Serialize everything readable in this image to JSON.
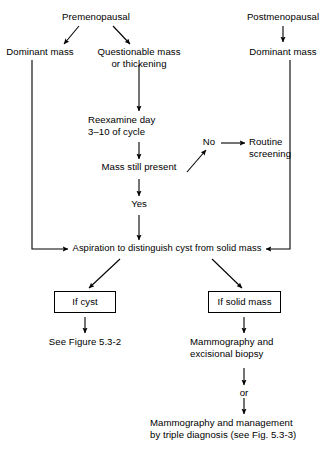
{
  "figure": {
    "kind": "clinical-algorithm-flowchart",
    "line_color": "#000000",
    "background_color": "#ffffff",
    "text_color": "#000000"
  },
  "nodes": {
    "premenopausal": "Premenopausal",
    "postmenopausal": "Postmenopausal",
    "dominant_mass_left": "Dominant mass",
    "dominant_mass_right": "Dominant mass",
    "questionable_mass": "Questionable mass\nor thickening",
    "reexamine": "Reexamine day\n3–10 of cycle",
    "mass_still_present": "Mass still present",
    "routine_screening": "Routine\nscreening",
    "aspiration": "Aspiration to distinguish cyst from solid mass",
    "if_cyst": "If cyst",
    "if_solid_mass": "If solid mass",
    "see_figure": "See Figure 5.3-2",
    "mammography_excisional": "Mammography and\nexcisional biopsy",
    "mammography_triple": "Mammography and management\nby triple diagnosis (see Fig. 5.3-3)"
  },
  "edge_labels": {
    "no": "No",
    "yes": "Yes",
    "or": "or"
  }
}
